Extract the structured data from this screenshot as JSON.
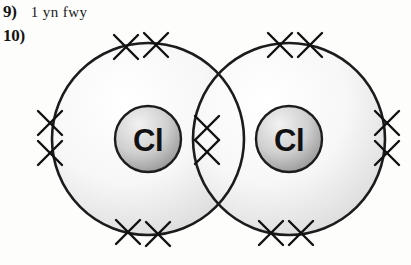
{
  "page": {
    "background_color": "#fdfdfc",
    "width": 411,
    "height": 265
  },
  "questions": [
    {
      "number": "9)",
      "text": "1 yn fwy"
    },
    {
      "number": "10)",
      "text": ""
    }
  ],
  "diagram": {
    "kind": "dot-and-cross-diagram",
    "molecule": "Cl2",
    "outline_color": "#1c1c1c",
    "shell_fill_light": "#fbfbfb",
    "shell_fill_dark": "#dcdcdc",
    "nucleus_fill_light": "#e9e9e9",
    "nucleus_fill_dark": "#9a9a9a",
    "electron_mark": "cross",
    "atoms": [
      {
        "symbol": "Cl",
        "side": "left",
        "shell_center_x": 148,
        "shell_center_y": 139,
        "shell_radius": 96,
        "nucleus_radius": 33
      },
      {
        "symbol": "Cl",
        "side": "right",
        "shell_center_x": 289,
        "shell_center_y": 139,
        "shell_radius": 96,
        "nucleus_radius": 33
      }
    ],
    "electron_groups": [
      {
        "label": "left-atom-top-pair",
        "count": 2
      },
      {
        "label": "left-atom-bottom-pair",
        "count": 2
      },
      {
        "label": "left-atom-outer-pair",
        "count": 2
      },
      {
        "label": "right-atom-top-pair",
        "count": 2
      },
      {
        "label": "right-atom-bottom-pair",
        "count": 2
      },
      {
        "label": "right-atom-outer-pair",
        "count": 2
      },
      {
        "label": "shared-bonding-pair",
        "count": 2
      }
    ]
  }
}
